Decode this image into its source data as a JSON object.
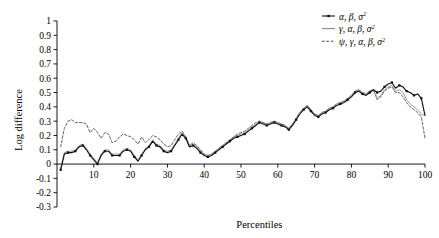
{
  "chart_data": {
    "type": "line",
    "title": "",
    "xlabel": "Percentiles",
    "ylabel": "Log difference",
    "xlim": [
      0,
      100
    ],
    "ylim": [
      -0.3,
      1.0
    ],
    "grid": false,
    "legend_position": "top-right",
    "x_ticks": [
      "10",
      "20",
      "30",
      "40",
      "50",
      "60",
      "70",
      "80",
      "90",
      "100"
    ],
    "x_tick_values": [
      10,
      20,
      30,
      40,
      50,
      60,
      70,
      80,
      90,
      100
    ],
    "y_ticks": [
      "1",
      "0.9",
      "0.8",
      "0.7",
      "0.6",
      "0.5",
      "0.4",
      "0.3",
      "0.2",
      "0.1",
      "0",
      "-0.1",
      "-0.2",
      "-0.3"
    ],
    "y_tick_values": [
      1,
      0.9,
      0.8,
      0.7,
      0.6,
      0.5,
      0.4,
      0.3,
      0.2,
      0.1,
      0,
      -0.1,
      -0.2,
      -0.3
    ],
    "x": [
      1,
      2,
      3,
      4,
      5,
      6,
      7,
      8,
      9,
      10,
      11,
      12,
      13,
      14,
      15,
      16,
      17,
      18,
      19,
      20,
      21,
      22,
      23,
      24,
      25,
      26,
      27,
      28,
      29,
      30,
      31,
      32,
      33,
      34,
      35,
      36,
      37,
      38,
      39,
      40,
      41,
      42,
      43,
      44,
      45,
      46,
      47,
      48,
      49,
      50,
      51,
      52,
      53,
      54,
      55,
      56,
      57,
      58,
      59,
      60,
      61,
      62,
      63,
      64,
      65,
      66,
      67,
      68,
      69,
      70,
      71,
      72,
      73,
      74,
      75,
      76,
      77,
      78,
      79,
      80,
      81,
      82,
      83,
      84,
      85,
      86,
      87,
      88,
      89,
      90,
      91,
      92,
      93,
      94,
      95,
      96,
      97,
      98,
      99,
      100
    ],
    "series": [
      {
        "name": "α, β, σ²",
        "style": "solid-marker",
        "color": "#101010",
        "marker": "square",
        "values": [
          -0.04,
          0.07,
          0.08,
          0.08,
          0.09,
          0.12,
          0.13,
          0.1,
          0.06,
          0.03,
          0.0,
          0.06,
          0.09,
          0.09,
          0.06,
          0.06,
          0.06,
          0.09,
          0.1,
          0.09,
          0.05,
          0.02,
          0.06,
          0.1,
          0.12,
          0.16,
          0.13,
          0.12,
          0.09,
          0.08,
          0.09,
          0.13,
          0.17,
          0.21,
          0.18,
          0.12,
          0.13,
          0.11,
          0.08,
          0.06,
          0.05,
          0.06,
          0.08,
          0.1,
          0.12,
          0.14,
          0.16,
          0.18,
          0.19,
          0.2,
          0.21,
          0.23,
          0.25,
          0.27,
          0.29,
          0.28,
          0.27,
          0.28,
          0.29,
          0.28,
          0.27,
          0.26,
          0.24,
          0.27,
          0.31,
          0.35,
          0.38,
          0.4,
          0.37,
          0.34,
          0.33,
          0.35,
          0.36,
          0.38,
          0.39,
          0.41,
          0.42,
          0.43,
          0.45,
          0.47,
          0.5,
          0.51,
          0.49,
          0.48,
          0.5,
          0.52,
          0.5,
          0.51,
          0.54,
          0.56,
          0.57,
          0.53,
          0.55,
          0.54,
          0.51,
          0.5,
          0.48,
          0.49,
          0.46,
          0.34
        ]
      },
      {
        "name": "γ, α, β, σ²",
        "style": "solid-light",
        "color": "#8a8a8a",
        "marker": "none",
        "values": [
          -0.03,
          0.08,
          0.09,
          0.09,
          0.1,
          0.13,
          0.14,
          0.11,
          0.07,
          0.04,
          0.01,
          0.07,
          0.1,
          0.1,
          0.07,
          0.07,
          0.07,
          0.1,
          0.11,
          0.1,
          0.06,
          0.03,
          0.07,
          0.11,
          0.13,
          0.17,
          0.14,
          0.13,
          0.1,
          0.09,
          0.1,
          0.14,
          0.18,
          0.22,
          0.19,
          0.13,
          0.14,
          0.12,
          0.09,
          0.07,
          0.06,
          0.07,
          0.09,
          0.11,
          0.13,
          0.15,
          0.17,
          0.19,
          0.2,
          0.21,
          0.22,
          0.24,
          0.26,
          0.28,
          0.3,
          0.29,
          0.28,
          0.29,
          0.3,
          0.29,
          0.28,
          0.27,
          0.25,
          0.28,
          0.32,
          0.36,
          0.39,
          0.41,
          0.38,
          0.35,
          0.34,
          0.36,
          0.37,
          0.39,
          0.4,
          0.42,
          0.43,
          0.44,
          0.46,
          0.48,
          0.51,
          0.52,
          0.5,
          0.49,
          0.51,
          0.52,
          0.46,
          0.48,
          0.52,
          0.54,
          0.55,
          0.51,
          0.52,
          0.5,
          0.45,
          0.42,
          0.4,
          0.38,
          0.35,
          0.34
        ]
      },
      {
        "name": "ψ, γ, α, β, σ²",
        "style": "dashed",
        "color": "#4a4a4a",
        "marker": "none",
        "values": [
          0.12,
          0.25,
          0.3,
          0.31,
          0.29,
          0.29,
          0.29,
          0.28,
          0.22,
          0.25,
          0.22,
          0.18,
          0.22,
          0.21,
          0.15,
          0.16,
          0.19,
          0.21,
          0.2,
          0.19,
          0.17,
          0.14,
          0.19,
          0.15,
          0.17,
          0.2,
          0.19,
          0.17,
          0.14,
          0.12,
          0.13,
          0.17,
          0.21,
          0.23,
          0.19,
          0.13,
          0.15,
          0.13,
          0.1,
          0.07,
          0.06,
          0.07,
          0.09,
          0.11,
          0.13,
          0.15,
          0.17,
          0.19,
          0.21,
          0.22,
          0.23,
          0.25,
          0.27,
          0.29,
          0.3,
          0.29,
          0.28,
          0.29,
          0.3,
          0.29,
          0.28,
          0.27,
          0.25,
          0.28,
          0.32,
          0.36,
          0.39,
          0.41,
          0.38,
          0.35,
          0.34,
          0.36,
          0.37,
          0.39,
          0.4,
          0.42,
          0.43,
          0.44,
          0.46,
          0.48,
          0.51,
          0.52,
          0.5,
          0.49,
          0.51,
          0.52,
          0.45,
          0.47,
          0.51,
          0.53,
          0.54,
          0.5,
          0.5,
          0.47,
          0.43,
          0.4,
          0.38,
          0.36,
          0.33,
          0.18
        ]
      }
    ]
  }
}
